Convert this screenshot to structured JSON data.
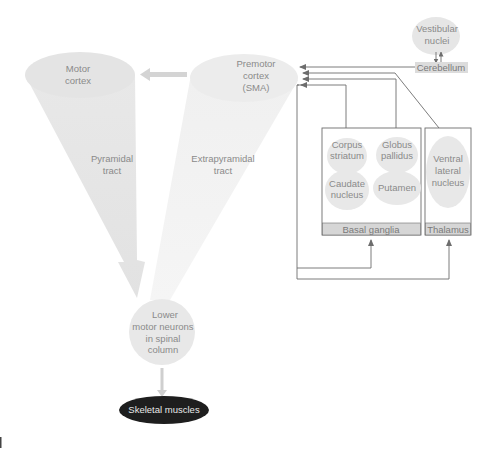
{
  "diagram": {
    "nodes": {
      "motor_cortex": {
        "line1": "Motor",
        "line2": "cortex"
      },
      "premotor_cortex": {
        "line1": "Premotor",
        "line2": "cortex",
        "line3": "(SMA)"
      },
      "vestibular_nuclei": {
        "line1": "Vestibular",
        "line2": "nuclei"
      },
      "cerebellum": {
        "label": "Cerebellum"
      },
      "corpus_striatum": {
        "line1": "Corpus",
        "line2": "striatum"
      },
      "globus_pallidus": {
        "line1": "Globus",
        "line2": "pallidus"
      },
      "caudate_nucleus": {
        "line1": "Caudate",
        "line2": "nucleus"
      },
      "putamen": {
        "label": "Putamen"
      },
      "ventral_lateral_nucleus": {
        "line1": "Ventral",
        "line2": "lateral",
        "line3": "nucleus"
      },
      "basal_ganglia": {
        "label": "Basal ganglia"
      },
      "thalamus": {
        "label": "Thalamus"
      },
      "lower_motor_neurons": {
        "line1": "Lower",
        "line2": "motor neurons",
        "line3": "in spinal",
        "line4": "column"
      },
      "skeletal_muscles": {
        "label": "Skeletal muscles"
      }
    },
    "tracts": {
      "pyramidal": {
        "line1": "Pyramidal",
        "line2": "tract"
      },
      "extrapyramidal": {
        "line1": "Extrapyramidal",
        "line2": "tract"
      }
    },
    "colors": {
      "node_fill": "#e6e6e6",
      "box_label_fill": "#d9d9d9",
      "line": "#6d6d6d",
      "text": "#8a8a8a",
      "skeletal_fill": "#1e1e1e"
    }
  }
}
